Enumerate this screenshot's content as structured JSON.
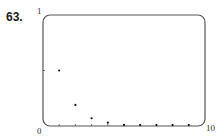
{
  "problem_label": "63.",
  "chart_data": {
    "type": "scatter",
    "title": "",
    "xlabel": "",
    "ylabel": "",
    "xlim": [
      0,
      10
    ],
    "ylim": [
      0,
      1
    ],
    "x_tick_labels": {
      "min": "0",
      "max": "10"
    },
    "y_tick_labels": {
      "max": "1"
    },
    "grid": false,
    "legend": null,
    "series": [
      {
        "name": "sequence",
        "x": [
          1,
          2,
          3,
          4,
          5,
          6,
          7,
          8,
          9
        ],
        "values": [
          0.5,
          0.19,
          0.07,
          0.03,
          0.01,
          0.005,
          0.002,
          0.001,
          0.0005
        ]
      }
    ]
  },
  "colors": {
    "frame": "#555555",
    "points": "#111111"
  }
}
